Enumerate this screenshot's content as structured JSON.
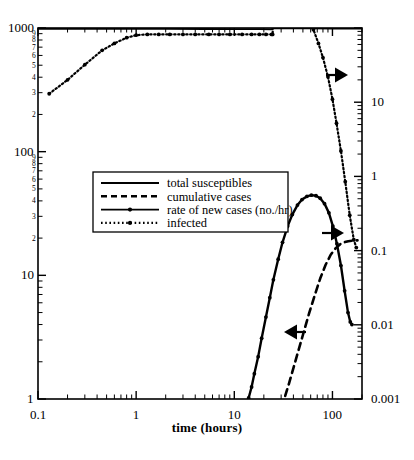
{
  "chart_data": {
    "type": "line",
    "title": "",
    "xlabel": "time (hours)",
    "ylabel_left": "",
    "ylabel_right": "",
    "xscale": "log",
    "yscale": "log",
    "xlim": [
      0.1,
      200
    ],
    "ylim_left": [
      1,
      1000
    ],
    "ylim_right": [
      0.001,
      100
    ],
    "grid": false,
    "legend_position": "center-left",
    "xticks_major": [
      "0.1",
      "1",
      "10",
      "100"
    ],
    "yticks_left_major": [
      "1000",
      "100",
      "10",
      "1"
    ],
    "yticks_left_minor": [
      "9",
      "8",
      "7",
      "6",
      "5",
      "4",
      "3",
      "2"
    ],
    "yticks_right_major": [
      "10",
      "1",
      "0.1",
      "0.01",
      "0.001"
    ],
    "annotations": [
      {
        "name": "arrow-right-infected",
        "direction": "right",
        "x": 0.74,
        "y": 0.135
      },
      {
        "name": "arrow-right-cumulative",
        "direction": "right",
        "x": 0.78,
        "y": 0.5
      },
      {
        "name": "arrow-left-rate",
        "direction": "left",
        "x": 0.7,
        "y": 0.72
      }
    ],
    "legend": [
      {
        "label": "total susceptibles",
        "style": "solid",
        "marker": "none",
        "axis": "left"
      },
      {
        "label": "cumulative cases",
        "style": "dashed",
        "marker": "none",
        "axis": "right"
      },
      {
        "label": "rate of new cases (no./hr)",
        "style": "solid",
        "marker": "dot",
        "axis": "left"
      },
      {
        "label": "infected",
        "style": "dotted",
        "marker": "dot",
        "axis": "right"
      }
    ],
    "series": [
      {
        "name": "total susceptibles",
        "axis": "left",
        "style": "solid",
        "x": [
          0.1,
          0.5,
          1,
          2,
          5,
          10,
          18,
          24,
          25,
          26,
          40,
          60,
          100,
          160,
          200
        ],
        "y": [
          985,
          985,
          984,
          983,
          982,
          980,
          978,
          976,
          994,
          994,
          993,
          992,
          991,
          990,
          990
        ]
      },
      {
        "name": "infected",
        "axis": "right",
        "style": "dotted",
        "x": [
          0.13,
          0.2,
          0.3,
          0.45,
          0.6,
          0.8,
          1.0,
          1.3,
          1.7,
          2.2,
          3,
          4,
          5.5,
          7,
          9,
          12,
          15,
          18,
          21,
          24,
          24.6,
          25,
          25.5,
          27,
          30,
          34,
          38,
          44,
          50,
          57,
          64,
          72,
          80,
          90,
          100,
          110,
          122,
          135,
          150,
          165,
          175
        ],
        "y": [
          13,
          20,
          32,
          50,
          62,
          74,
          80,
          82,
          82,
          82,
          82,
          82,
          82,
          82,
          82,
          82,
          82,
          82,
          82,
          82,
          82,
          260,
          280,
          285,
          278,
          262,
          240,
          205,
          170,
          130,
          95,
          62,
          40,
          22,
          11,
          5.2,
          2.2,
          0.85,
          0.3,
          0.14,
          0.11
        ]
      },
      {
        "name": "rate of new cases (no./hr)",
        "axis": "left",
        "style": "solid-dot",
        "x": [
          14,
          15,
          16,
          17.5,
          19,
          21,
          23,
          25,
          28,
          31,
          35,
          39,
          44,
          49,
          55,
          61,
          68,
          75,
          83,
          92,
          101,
          111,
          122,
          133,
          144,
          152,
          158
        ],
        "y": [
          1.02,
          1.25,
          1.6,
          2.2,
          3.1,
          4.6,
          6.6,
          9.2,
          13.5,
          18.5,
          25,
          31,
          37,
          41,
          43.5,
          44.5,
          44,
          42,
          38,
          32,
          25,
          18,
          12,
          7.5,
          5.0,
          4.2,
          4.0
        ]
      },
      {
        "name": "cumulative cases",
        "axis": "right",
        "style": "dashed",
        "x": [
          33,
          36,
          40,
          45,
          51,
          58,
          66,
          75,
          85,
          96,
          108,
          120,
          133,
          145,
          158,
          170,
          180
        ],
        "y": [
          0.0011,
          0.0016,
          0.0026,
          0.0045,
          0.008,
          0.0145,
          0.025,
          0.042,
          0.064,
          0.088,
          0.108,
          0.122,
          0.13,
          0.134,
          0.136,
          0.137,
          0.1375
        ]
      }
    ]
  },
  "axes": {
    "x_label": "time (hours)",
    "x_major": [
      {
        "v": "0.1",
        "val": 0.1
      },
      {
        "v": "1",
        "val": 1
      },
      {
        "v": "10",
        "val": 10
      },
      {
        "v": "100",
        "val": 100
      }
    ],
    "y_left_major": [
      {
        "v": "1000",
        "val": 1000
      },
      {
        "v": "100",
        "val": 100
      },
      {
        "v": "10",
        "val": 10
      },
      {
        "v": "1",
        "val": 1
      }
    ],
    "y_left_minor_decades": [
      {
        "decade": 100,
        "labels": [
          "9",
          "8",
          "7",
          "6",
          "5",
          "4",
          "3",
          "2"
        ]
      },
      {
        "decade": 10,
        "labels": [
          "9",
          "8",
          "7",
          "6",
          "5",
          "4",
          "3",
          "2"
        ]
      }
    ],
    "y_right_major": [
      {
        "v": "10",
        "val": 10
      },
      {
        "v": "1",
        "val": 1
      },
      {
        "v": "0.1",
        "val": 0.1
      },
      {
        "v": "0.01",
        "val": 0.01
      },
      {
        "v": "0.001",
        "val": 0.001
      }
    ]
  },
  "legend": {
    "items": [
      {
        "label": "total susceptibles"
      },
      {
        "label": "cumulative cases"
      },
      {
        "label": "rate of new cases (no./hr)"
      },
      {
        "label": "infected"
      }
    ]
  }
}
